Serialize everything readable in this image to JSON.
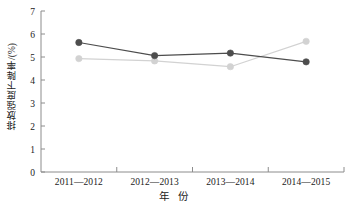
{
  "chart_data": {
    "type": "line",
    "title": "",
    "subtitle": "",
    "xlabel": "年 份",
    "ylabel": "排放强度下降率/(%)",
    "categories": [
      "2011—2012",
      "2012—2013",
      "2013—2014",
      "2014—2015"
    ],
    "ylim": [
      0,
      7
    ],
    "yticks": [
      0,
      1,
      2,
      3,
      4,
      5,
      6,
      7
    ],
    "ytick_labels": [
      "0",
      "1",
      "2",
      "3",
      "4",
      "5",
      "6",
      "7"
    ],
    "grid": false,
    "legend": "none",
    "series": [
      {
        "name": "series-dark",
        "color": "#4d4d4d",
        "marker": "circle",
        "values": [
          5.63,
          5.06,
          5.17,
          4.79
        ]
      },
      {
        "name": "series-light",
        "color": "#d2d2d2",
        "marker": "circle",
        "values": [
          4.93,
          4.83,
          4.58,
          5.68
        ]
      }
    ],
    "axis_color": "#8c8c8c"
  }
}
